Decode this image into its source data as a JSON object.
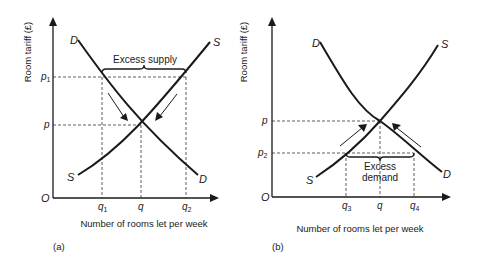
{
  "panels": [
    {
      "id": "a",
      "caption": "(a)",
      "ylabel": "Room tariff (£)",
      "xlabel": "Number of rooms let per week",
      "origin": "O",
      "curves": {
        "demand_start": "D",
        "demand_end": "D",
        "supply_start": "S",
        "supply_end": "S"
      },
      "price_ticks": [
        {
          "label": "p",
          "sub": "1"
        },
        {
          "label": "p",
          "sub": ""
        }
      ],
      "quantity_ticks": [
        {
          "label": "q",
          "sub": "1"
        },
        {
          "label": "q",
          "sub": ""
        },
        {
          "label": "q",
          "sub": "2"
        }
      ],
      "annotation_line1": "Excess supply",
      "annotation_line2": ""
    },
    {
      "id": "b",
      "caption": "(b)",
      "ylabel": "Room tariff (£)",
      "xlabel": "Number of rooms let per week",
      "origin": "O",
      "curves": {
        "demand_start": "D",
        "demand_end": "D",
        "supply_start": "S",
        "supply_end": "S"
      },
      "price_ticks": [
        {
          "label": "p",
          "sub": ""
        },
        {
          "label": "p",
          "sub": "2"
        }
      ],
      "quantity_ticks": [
        {
          "label": "q",
          "sub": "3"
        },
        {
          "label": "q",
          "sub": ""
        },
        {
          "label": "q",
          "sub": "4"
        }
      ],
      "annotation_line1": "Excess",
      "annotation_line2": "demand"
    }
  ]
}
